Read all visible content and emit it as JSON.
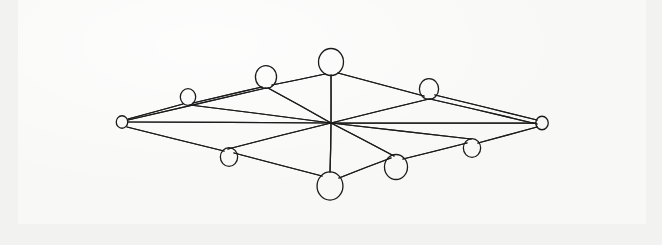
{
  "page": {
    "background_color": "#f2f2f1",
    "paper_color": "#f8f8f7",
    "ink_color": "#1b1b1b"
  },
  "chart_data": {
    "type": "diagram",
    "subtype": "node-link-graph",
    "title": "",
    "xlabel": "",
    "ylabel": "",
    "node_count": 11,
    "edge_count": 22,
    "nodes": [
      {
        "id": "left-apex",
        "label": "",
        "x": 122,
        "y": 122,
        "r": 6,
        "size": "small"
      },
      {
        "id": "right-apex",
        "label": "",
        "x": 542,
        "y": 123,
        "r": 6.5,
        "size": "small"
      },
      {
        "id": "upper-left-1",
        "label": "",
        "x": 188,
        "y": 97,
        "r": 8,
        "size": "small"
      },
      {
        "id": "upper-left-2",
        "label": "",
        "x": 266,
        "y": 77,
        "r": 11,
        "size": "medium"
      },
      {
        "id": "top-center",
        "label": "",
        "x": 331,
        "y": 62,
        "r": 13,
        "size": "large"
      },
      {
        "id": "upper-right-1",
        "label": "",
        "x": 429,
        "y": 89,
        "r": 10,
        "size": "medium"
      },
      {
        "id": "lower-left-1",
        "label": "",
        "x": 229,
        "y": 157,
        "r": 9,
        "size": "small"
      },
      {
        "id": "bottom-center",
        "label": "",
        "x": 330,
        "y": 186,
        "r": 13.5,
        "size": "large"
      },
      {
        "id": "lower-right-1",
        "label": "",
        "x": 396,
        "y": 167,
        "r": 12,
        "size": "medium"
      },
      {
        "id": "lower-right-2",
        "label": "",
        "x": 472,
        "y": 148,
        "r": 9,
        "size": "small"
      },
      {
        "id": "center-hub",
        "label": "",
        "x": 331,
        "y": 123,
        "r": 0,
        "size": "none"
      }
    ],
    "edges": [
      {
        "from": "left-apex",
        "to": "upper-left-1",
        "x1": 128,
        "y1": 119,
        "x2": 183,
        "y2": 104
      },
      {
        "from": "upper-left-1",
        "to": "upper-left-2",
        "x1": 193,
        "y1": 103,
        "x2": 262,
        "y2": 87
      },
      {
        "from": "upper-left-2",
        "to": "top-center",
        "x1": 272,
        "y1": 85,
        "x2": 325,
        "y2": 74
      },
      {
        "from": "top-center",
        "to": "upper-right-1",
        "x1": 338,
        "y1": 73,
        "x2": 424,
        "y2": 96
      },
      {
        "from": "upper-right-1",
        "to": "right-apex",
        "x1": 435,
        "y1": 95,
        "x2": 537,
        "y2": 120
      },
      {
        "from": "left-apex",
        "to": "lower-left-1",
        "x1": 127,
        "y1": 127,
        "x2": 224,
        "y2": 151
      },
      {
        "from": "lower-left-1",
        "to": "bottom-center",
        "x1": 234,
        "y1": 153,
        "x2": 322,
        "y2": 176
      },
      {
        "from": "bottom-center",
        "to": "lower-right-1",
        "x1": 339,
        "y1": 178,
        "x2": 391,
        "y2": 158
      },
      {
        "from": "lower-right-1",
        "to": "lower-right-2",
        "x1": 403,
        "y1": 159,
        "x2": 467,
        "y2": 143
      },
      {
        "from": "lower-right-2",
        "to": "right-apex",
        "x1": 478,
        "y1": 143,
        "x2": 537,
        "y2": 127
      },
      {
        "from": "left-apex",
        "to": "center-hub",
        "x1": 128,
        "y1": 122,
        "x2": 331,
        "y2": 123
      },
      {
        "from": "center-hub",
        "to": "right-apex",
        "x1": 331,
        "y1": 123,
        "x2": 536,
        "y2": 123
      },
      {
        "from": "upper-left-1",
        "to": "center-hub",
        "x1": 190,
        "y1": 105,
        "x2": 331,
        "y2": 123
      },
      {
        "from": "upper-left-2",
        "to": "center-hub",
        "x1": 268,
        "y1": 88,
        "x2": 331,
        "y2": 123
      },
      {
        "from": "top-center",
        "to": "center-hub",
        "x1": 331,
        "y1": 75,
        "x2": 331,
        "y2": 123
      },
      {
        "from": "upper-right-1",
        "to": "center-hub",
        "x1": 429,
        "y1": 99,
        "x2": 331,
        "y2": 123
      },
      {
        "from": "center-hub",
        "to": "lower-left-1",
        "x1": 331,
        "y1": 123,
        "x2": 228,
        "y2": 149
      },
      {
        "from": "center-hub",
        "to": "bottom-center",
        "x1": 331,
        "y1": 123,
        "x2": 330,
        "y2": 172
      },
      {
        "from": "center-hub",
        "to": "lower-right-1",
        "x1": 331,
        "y1": 123,
        "x2": 394,
        "y2": 156
      },
      {
        "from": "center-hub",
        "to": "lower-right-2",
        "x1": 331,
        "y1": 123,
        "x2": 471,
        "y2": 139
      },
      {
        "from": "left-apex",
        "to": "upper-left-2",
        "x1": 128,
        "y1": 120,
        "x2": 266,
        "y2": 88
      },
      {
        "from": "upper-right-1",
        "to": "right-apex",
        "x1": 430,
        "y1": 99,
        "x2": 537,
        "y2": 124
      }
    ]
  }
}
